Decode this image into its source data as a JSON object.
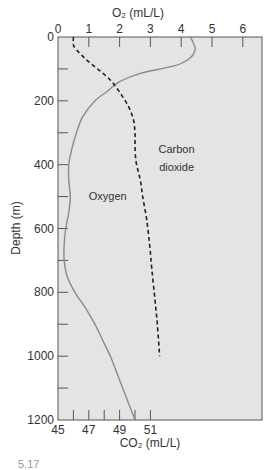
{
  "chart_data": {
    "type": "line",
    "title": "",
    "top_xlabel": "O₂ (mL/L)",
    "bottom_xlabel": "CO₂ (mL/L)",
    "ylabel": "Depth (m)",
    "top_axis": {
      "label": "O2 (mL/L)",
      "range": [
        0,
        6.6
      ],
      "ticks": [
        0,
        1,
        2,
        3,
        4,
        5,
        6
      ]
    },
    "bottom_axis": {
      "label": "CO2 (mL/L)",
      "range": [
        45,
        51.6
      ],
      "ticks": [
        45,
        46,
        47,
        48,
        49,
        50,
        51
      ],
      "tick_labels": [
        "45",
        "",
        "47",
        "",
        "49",
        "",
        "51"
      ]
    },
    "y_axis": {
      "label": "Depth (m)",
      "range": [
        0,
        1200
      ],
      "inverted": true,
      "ticks": [
        0,
        100,
        200,
        300,
        400,
        500,
        600,
        700,
        800,
        900,
        1000,
        1100,
        1200
      ],
      "tick_labels": [
        "0",
        "",
        "200",
        "",
        "400",
        "",
        "600",
        "",
        "800",
        "",
        "1000",
        "",
        "1200"
      ]
    },
    "grid": false,
    "series": [
      {
        "name": "Oxygen",
        "axis": "top",
        "style": "solid",
        "color": "#8a8a8a",
        "depth": [
          0,
          20,
          40,
          65,
          90,
          113,
          140,
          170,
          200,
          250,
          300,
          350,
          400,
          450,
          500,
          550,
          600,
          650,
          700,
          750,
          800,
          850,
          900,
          950,
          1000,
          1050,
          1100,
          1150,
          1200
        ],
        "values": [
          4.3,
          4.4,
          4.45,
          4.3,
          3.8,
          2.7,
          2.0,
          1.6,
          1.2,
          0.8,
          0.6,
          0.45,
          0.35,
          0.35,
          0.4,
          0.35,
          0.25,
          0.2,
          0.2,
          0.3,
          0.55,
          0.9,
          1.2,
          1.45,
          1.7,
          1.9,
          2.1,
          2.3,
          2.5
        ]
      },
      {
        "name": "Carbon dioxide",
        "axis": "bottom",
        "style": "dashed",
        "color": "#222222",
        "depth": [
          0,
          25,
          40,
          65,
          90,
          113,
          140,
          180,
          220,
          260,
          300,
          340,
          385,
          420,
          450,
          500,
          570,
          650,
          730,
          825,
          900,
          1000
        ],
        "values": [
          46.0,
          46.0,
          46.2,
          46.7,
          47.3,
          47.9,
          48.5,
          49.1,
          49.6,
          49.9,
          50.0,
          50.0,
          50.05,
          50.2,
          50.35,
          50.5,
          50.75,
          50.95,
          51.1,
          51.3,
          51.45,
          51.6
        ]
      }
    ],
    "annotations": [
      {
        "text": "Oxygen",
        "depth": 510,
        "x_o2": 1.0
      },
      {
        "text": "Carbon",
        "depth": 365,
        "x_o2": 3.85
      },
      {
        "text": "dioxide",
        "depth": 420,
        "x_o2": 3.85
      }
    ],
    "legend": null
  },
  "figure": {
    "caption_fragment": "5.17"
  }
}
